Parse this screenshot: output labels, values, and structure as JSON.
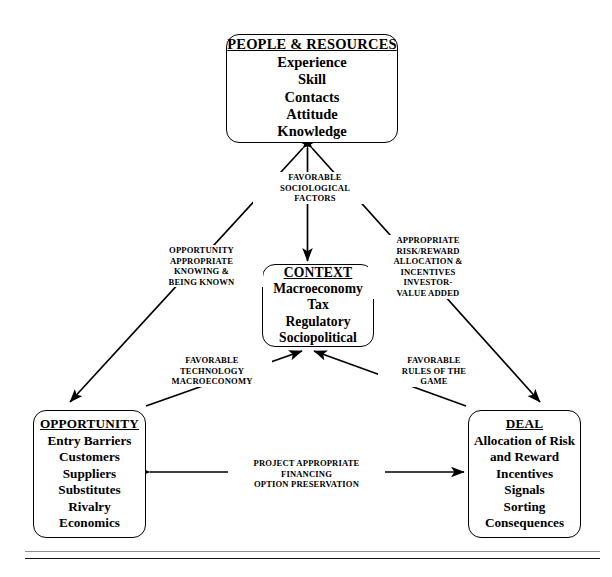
{
  "diagram": {
    "nodes": {
      "people": {
        "title": "PEOPLE & RESOURCES",
        "items": [
          "Experience",
          "Skill",
          "Contacts",
          "Attitude",
          "Knowledge"
        ]
      },
      "context": {
        "title": "CONTEXT",
        "items": [
          "Macroeconomy",
          "Tax",
          "Regulatory",
          "Sociopolitical"
        ]
      },
      "opportunity": {
        "title": "OPPORTUNITY",
        "items": [
          "Entry Barriers",
          "Customers",
          "Suppliers",
          "Substitutes",
          "Rivalry",
          "Economics"
        ]
      },
      "deal": {
        "title": "DEAL",
        "items": [
          "Allocation of Risk",
          "and Reward",
          "Incentives",
          "Signals",
          "Sorting",
          "Consequences"
        ]
      }
    },
    "edge_labels": {
      "people_context": [
        "FAVORABLE",
        "SOCIOLOGICAL",
        "FACTORS"
      ],
      "people_opportunity": [
        "OPPORTUNITY",
        "APPROPRIATE",
        "KNOWING &",
        "BEING KNOWN"
      ],
      "people_deal": [
        "APPROPRIATE",
        "RISK/REWARD",
        "ALLOCATION &",
        "INCENTIVES",
        "INVESTOR-",
        "VALUE ADDED"
      ],
      "opportunity_context": [
        "FAVORABLE",
        "TECHNOLOGY",
        "MACROECONOMY"
      ],
      "deal_context": [
        "FAVORABLE",
        "RULES OF THE",
        "GAME"
      ],
      "opportunity_deal": [
        "PROJECT APPROPRIATE",
        "FINANCING",
        "OPTION PRESERVATION"
      ]
    },
    "colors": {
      "stroke": "#000000",
      "background": "#ffffff",
      "rule_light": "#8e8e8e",
      "rule_dark": "#111111"
    }
  }
}
